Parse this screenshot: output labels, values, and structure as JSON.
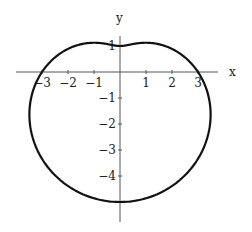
{
  "chart_data": {
    "type": "line",
    "title": "",
    "xlabel": "x",
    "ylabel": "y",
    "xlim": [
      -3.9,
      3.8
    ],
    "ylim": [
      -5.8,
      2.1
    ],
    "grid": false,
    "legend": null,
    "x_ticks": [
      -3,
      -2,
      -1,
      1,
      2,
      3
    ],
    "x_tick_labels": [
      "-3",
      "-2",
      "-1",
      "1",
      "2",
      "3"
    ],
    "y_ticks": [
      1,
      -1,
      -2,
      -3,
      -4
    ],
    "y_tick_labels": [
      "1",
      "-1",
      "-2",
      "-3",
      "-4"
    ],
    "series": [
      {
        "name": "r = 3 - 2 sin(theta)",
        "polar": {
          "a": 3,
          "b": -2,
          "func": "sin"
        },
        "key_points": [
          {
            "x": 3,
            "y": 0
          },
          {
            "x": 0,
            "y": 1
          },
          {
            "x": -3,
            "y": 0
          },
          {
            "x": 0,
            "y": -5
          }
        ]
      }
    ]
  },
  "labels": {
    "x_axis": "x",
    "y_axis": "y",
    "x_ticks": [
      "-3",
      "-2",
      "-1",
      "1",
      "2",
      "3"
    ],
    "y_ticks": [
      "1",
      "-1",
      "-2",
      "-3",
      "-4"
    ]
  }
}
